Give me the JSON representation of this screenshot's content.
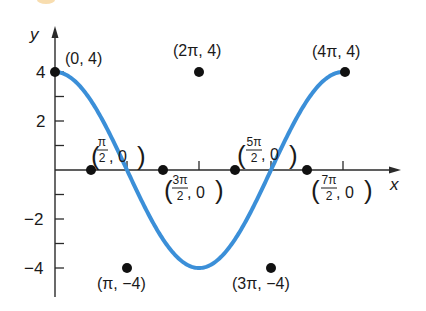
{
  "chart_data": {
    "type": "line",
    "title": "",
    "function": "y = 4 cos(x/2)",
    "xlabel": "x",
    "ylabel": "y",
    "xlim": [
      0,
      12.566
    ],
    "ylim": [
      -4,
      4
    ],
    "y_ticks": [
      -4,
      -3,
      -2,
      -1,
      1,
      2,
      3,
      4
    ],
    "y_tick_labels": [
      "-4",
      "-2",
      "2",
      "4"
    ],
    "x_ticks": [
      "π",
      "2π",
      "3π",
      "4π"
    ],
    "grid": false,
    "curve_color": "#3b8fd8",
    "points": [
      {
        "label": "(0, 4)",
        "x": 0,
        "y": 4
      },
      {
        "label": "(π/2, 0)",
        "x": 1.5708,
        "y": 0
      },
      {
        "label": "(π, −4)",
        "x": 3.1416,
        "y": -4
      },
      {
        "label": "(3π/2, 0)",
        "x": 4.7124,
        "y": 0
      },
      {
        "label": "(2π, 4)",
        "x": 6.2832,
        "y": 4
      },
      {
        "label": "(5π/2, 0)",
        "x": 7.854,
        "y": 0
      },
      {
        "label": "(3π, −4)",
        "x": 9.4248,
        "y": -4
      },
      {
        "label": "(7π/2, 0)",
        "x": 10.9956,
        "y": 0
      },
      {
        "label": "(4π, 4)",
        "x": 12.5664,
        "y": 4
      }
    ]
  },
  "labels": {
    "axis_x": "x",
    "axis_y": "y",
    "tick_4": "4",
    "tick_2": "2",
    "tick_m2": "−2",
    "tick_m4": "−4",
    "pt_0_4": "(0, 4)",
    "pt_2pi_4": "(2π, 4)",
    "pt_4pi_4": "(4π, 4)",
    "pt_pi_m4": "(π, −4)",
    "pt_3pi_m4": "(3π, −4)",
    "frac_pi2_num": "π",
    "frac_3pi2_num": "3π",
    "frac_5pi2_num": "5π",
    "frac_7pi2_num": "7π",
    "frac_den": "2",
    "zero_suffix": ", 0",
    "paren_open": "(",
    "paren_close": ")"
  }
}
